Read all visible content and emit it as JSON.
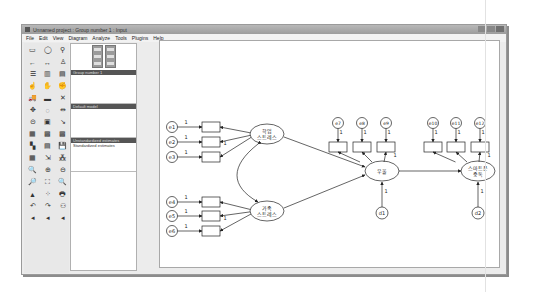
{
  "window": {
    "title": "Unnamed project : Group number 1 : Input",
    "controls": [
      "minimize",
      "maximize",
      "close"
    ]
  },
  "menubar": {
    "items": [
      "File",
      "Edit",
      "View",
      "Diagram",
      "Analyze",
      "Tools",
      "Plugins",
      "Help"
    ]
  },
  "toolbox": {
    "tools": [
      {
        "name": "draw-observed-variable-icon",
        "glyph": "▭"
      },
      {
        "name": "draw-unobserved-variable-icon",
        "glyph": "◯"
      },
      {
        "name": "draw-latent-indicator-icon",
        "glyph": "⚲"
      },
      {
        "name": "draw-path-icon",
        "glyph": "←"
      },
      {
        "name": "draw-covariance-icon",
        "glyph": "↔"
      },
      {
        "name": "add-unique-variable-icon",
        "glyph": "♙"
      },
      {
        "name": "list-variables-in-model-icon",
        "glyph": "☰"
      },
      {
        "name": "list-variables-in-dataset-icon",
        "glyph": "▥"
      },
      {
        "name": "select-one-object-icon",
        "glyph": "▤"
      },
      {
        "name": "select-all-objects-icon",
        "glyph": "☝"
      },
      {
        "name": "deselect-all-objects-icon",
        "glyph": "✋"
      },
      {
        "name": "duplicate-objects-icon",
        "glyph": "✊"
      },
      {
        "name": "move-objects-icon",
        "glyph": "🚚"
      },
      {
        "name": "erase-objects-icon",
        "glyph": "▬"
      },
      {
        "name": "erase-icon",
        "glyph": "✕"
      },
      {
        "name": "change-shape-icon",
        "glyph": "✥"
      },
      {
        "name": "rotate-indicators-icon",
        "glyph": "◌"
      },
      {
        "name": "reflect-indicators-icon",
        "glyph": "⇹"
      },
      {
        "name": "move-parameter-icon",
        "glyph": "⊝"
      },
      {
        "name": "scroll-icon",
        "glyph": "▣"
      },
      {
        "name": "touch-up-icon",
        "glyph": "↘"
      },
      {
        "name": "select-data-files-icon",
        "glyph": "▦"
      },
      {
        "name": "analysis-properties-icon",
        "glyph": "▩"
      },
      {
        "name": "calculate-estimates-icon",
        "glyph": "▩"
      },
      {
        "name": "copy-to-clipboard-icon",
        "glyph": "▚"
      },
      {
        "name": "view-text-icon",
        "glyph": "▤"
      },
      {
        "name": "save-icon",
        "glyph": "💾"
      },
      {
        "name": "object-properties-icon",
        "glyph": "▦"
      },
      {
        "name": "drag-properties-icon",
        "glyph": "⇲"
      },
      {
        "name": "preserve-symmetries-icon",
        "glyph": "⁂"
      },
      {
        "name": "zoom-select-icon",
        "glyph": "🔍"
      },
      {
        "name": "zoom-in-icon",
        "glyph": "⊕"
      },
      {
        "name": "zoom-out-icon",
        "glyph": "⊖"
      },
      {
        "name": "view-page-icon",
        "glyph": "🔎"
      },
      {
        "name": "fit-to-page-icon",
        "glyph": "⛶"
      },
      {
        "name": "loupe-icon",
        "glyph": "🔍"
      },
      {
        "name": "bayesian-estimation-icon",
        "glyph": "▲"
      },
      {
        "name": "multiple-group-analysis-icon",
        "glyph": "⁘"
      },
      {
        "name": "print-icon",
        "glyph": "🖶"
      },
      {
        "name": "undo-icon",
        "glyph": "↶"
      },
      {
        "name": "redo-icon",
        "glyph": "↷"
      },
      {
        "name": "specification-search-icon",
        "glyph": "⚇"
      },
      {
        "name": "scroll-left-1-icon",
        "glyph": "◂"
      },
      {
        "name": "scroll-left-2-icon",
        "glyph": "◂"
      },
      {
        "name": "scroll-left-3-icon",
        "glyph": "◂"
      }
    ]
  },
  "side_panel": {
    "view_buttons": [
      "view-input-path-diagram",
      "view-output-path-diagram"
    ],
    "sections": [
      {
        "header": "Group number 1",
        "items": []
      },
      {
        "header": "Default model",
        "items": []
      },
      {
        "header": "Unstandardized estimates",
        "items": [
          "Standardized estimates"
        ]
      }
    ]
  },
  "diagram": {
    "latent_variables": [
      {
        "id": "academic_stress",
        "label_line1": "학업",
        "label_line2": "스트레스",
        "cx": 107,
        "cy": 93
      },
      {
        "id": "family_stress",
        "label_line1": "가족",
        "label_line2": "스트레스",
        "cx": 107,
        "cy": 170
      },
      {
        "id": "depression",
        "label_line1": "우울",
        "label_line2": "",
        "cx": 222,
        "cy": 130
      },
      {
        "id": "smartphone_addiction",
        "label_line1": "스마트폰",
        "label_line2": "중독",
        "cx": 318,
        "cy": 130
      }
    ],
    "error_terms": [
      {
        "label": "e1",
        "cx": 12,
        "cy": 86
      },
      {
        "label": "e2",
        "cx": 12,
        "cy": 101
      },
      {
        "label": "e3",
        "cx": 12,
        "cy": 116
      },
      {
        "label": "e4",
        "cx": 12,
        "cy": 161
      },
      {
        "label": "e5",
        "cx": 12,
        "cy": 175
      },
      {
        "label": "e6",
        "cx": 12,
        "cy": 190
      },
      {
        "label": "e7",
        "cx": 178,
        "cy": 82
      },
      {
        "label": "e8",
        "cx": 202,
        "cy": 82
      },
      {
        "label": "e9",
        "cx": 226,
        "cy": 82
      },
      {
        "label": "e10",
        "cx": 273,
        "cy": 82
      },
      {
        "label": "e11",
        "cx": 296,
        "cy": 82
      },
      {
        "label": "e12",
        "cx": 320,
        "cy": 82
      }
    ],
    "disturbances": [
      {
        "label": "d1",
        "cx": 222,
        "cy": 172
      },
      {
        "label": "d2",
        "cx": 318,
        "cy": 172
      }
    ],
    "fixed_parameter": "1"
  }
}
